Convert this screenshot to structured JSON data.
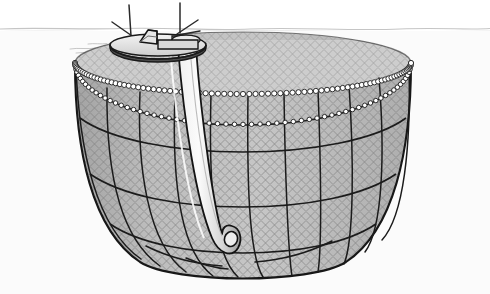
{
  "illustration": {
    "title": "Aquaculture net pen with service vessel",
    "subject": "fish-farm-cage",
    "style": "line-drawing-greyscale",
    "canvas": {
      "width": 490,
      "height": 294
    },
    "background_color": "#ffffff",
    "waterline": {
      "label": "sea surface",
      "y": 30,
      "color": "#c9c9c9",
      "visible": true
    },
    "colors": {
      "outline": "#1a1a1a",
      "net_fill": "#b3b3b3",
      "net_fill_light": "#c4c4c4",
      "mesh_line": "#6f6f6f",
      "rope_line": "#141414",
      "float_bead_fill": "#ffffff",
      "float_bead_stroke": "#1c1c1c",
      "hull_top": "#e8e8e8",
      "hull_side": "#5a5a5a",
      "pipe_fill": "#f2f2f2",
      "pipe_shade": "#cfcfcf",
      "water_tint": "#f7f7f7"
    },
    "parts": [
      {
        "id": "vessel",
        "label": "Service vessel / feed barge",
        "count": 1
      },
      {
        "id": "mast-left",
        "label": "Left mast with outrigger",
        "count": 1
      },
      {
        "id": "mast-right",
        "label": "Right mast with outrigger",
        "count": 1
      },
      {
        "id": "wheelhouse",
        "label": "Wheelhouse",
        "count": 1
      },
      {
        "id": "float-collar",
        "label": "Floating collar (near rim)",
        "count": 1
      },
      {
        "id": "far-rim",
        "label": "Far rim of floating collar",
        "count": 1
      },
      {
        "id": "net-bag",
        "label": "Conical net bag",
        "count": 1
      },
      {
        "id": "vertical-ropes",
        "label": "Vertical support ropes",
        "count": 11
      },
      {
        "id": "horizontal-ropes",
        "label": "Horizontal girth ropes",
        "count": 3
      },
      {
        "id": "lift-pipe",
        "label": "Dead-fish lift pipe / feed hose",
        "count": 1
      },
      {
        "id": "mesh",
        "label": "Diamond netting mesh",
        "count": 1
      }
    ],
    "float_beads": {
      "near_rim_count": 84,
      "far_rim_count": 62,
      "radius": 2.6
    },
    "geometry": {
      "rim_center_x": 243,
      "rim_center_y": 63,
      "rim_rx": 168,
      "rim_ry": 31,
      "bag_bottom_y": 274,
      "bag_half_width": 150,
      "far_rim_drop": 62
    },
    "ropes": {
      "vertical_count": 11,
      "girth_levels": [
        120,
        176,
        224
      ]
    }
  }
}
